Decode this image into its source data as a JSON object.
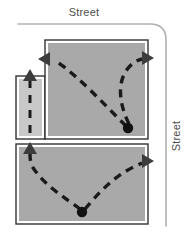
{
  "diagram": {
    "labels": {
      "street_top": "Street",
      "street_right": "Street"
    },
    "colors": {
      "lot_fill": "#a9a9a9",
      "aisle_fill": "#c8c8c8",
      "lot_outline": "#333333",
      "lot_inner_outline": "#ffffff",
      "street_line": "#b0b0b0",
      "path_stroke": "#1a1a1a",
      "arrow_fill": "#3c3c3c",
      "dot_fill": "#111111",
      "label_text": "#4d4d4d",
      "background": "#ffffff"
    },
    "streets": {
      "top": {
        "name": "top-street-line",
        "orientation": "horizontal",
        "from_x": 18,
        "to_x": 150,
        "y": 24
      },
      "right": {
        "name": "right-street-line",
        "orientation": "vertical",
        "x": 166,
        "from_y": 40,
        "to_y": 226
      },
      "corner_radius": 16
    },
    "blocks": [
      {
        "name": "upper-parking-lot",
        "shape": "notched-rectangle",
        "x": 45,
        "y": 40,
        "width": 103,
        "height": 98,
        "notch": {
          "x": 16,
          "y": 76,
          "width": 29,
          "height": 62
        }
      },
      {
        "name": "lower-parking-lot",
        "shape": "rectangle",
        "x": 16,
        "y": 145,
        "width": 132,
        "height": 79
      },
      {
        "name": "left-drive-aisle",
        "shape": "rectangle",
        "x": 16,
        "y": 76,
        "width": 29,
        "height": 62
      }
    ],
    "paths": [
      {
        "name": "upper-exit-left-path",
        "style": "dashed",
        "origin": "upper-dot",
        "terminus": "left-arrow-upper",
        "direction": "west"
      },
      {
        "name": "upper-exit-right-path",
        "style": "dashed",
        "origin": "upper-dot",
        "terminus": "right-arrow-upper",
        "direction": "east"
      },
      {
        "name": "lower-exit-left-path",
        "style": "dashed",
        "origin": "lower-dot",
        "terminus": "up-arrow-lower-left",
        "direction": "north"
      },
      {
        "name": "lower-exit-right-path",
        "style": "dashed",
        "origin": "lower-dot",
        "terminus": "right-arrow-lower",
        "direction": "east"
      },
      {
        "name": "aisle-through-path",
        "style": "dashed",
        "origin": "aisle-bottom",
        "terminus": "up-arrow-aisle",
        "direction": "north"
      }
    ],
    "arrows": [
      {
        "name": "left-arrow-upper",
        "x": 44,
        "y": 59,
        "direction": "west"
      },
      {
        "name": "right-arrow-upper",
        "x": 148,
        "y": 58,
        "direction": "east"
      },
      {
        "name": "up-arrow-aisle",
        "x": 30,
        "y": 74,
        "direction": "north"
      },
      {
        "name": "up-arrow-lower-left",
        "x": 30,
        "y": 147,
        "direction": "north"
      },
      {
        "name": "right-arrow-lower",
        "x": 148,
        "y": 161,
        "direction": "east"
      }
    ],
    "dots": [
      {
        "name": "upper-origin-dot",
        "x": 128,
        "y": 128,
        "radius": 5
      },
      {
        "name": "lower-origin-dot",
        "x": 82,
        "y": 212,
        "radius": 5
      }
    ]
  }
}
